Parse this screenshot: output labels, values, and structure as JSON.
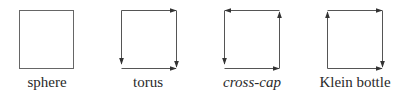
{
  "figure": {
    "stroke_color": "#555555",
    "items": [
      {
        "label": "sphere",
        "italic": false,
        "edges": "none"
      },
      {
        "label": "torus",
        "italic": false,
        "edges": "top-right, right-down, bottom-right, left-down"
      },
      {
        "label": "cross-cap",
        "italic": true,
        "edges": "top-left, right-up, bottom-right, left-down"
      },
      {
        "label": "Klein bottle",
        "italic": false,
        "edges": "top-right, right-down, bottom-right, left-up"
      }
    ]
  }
}
